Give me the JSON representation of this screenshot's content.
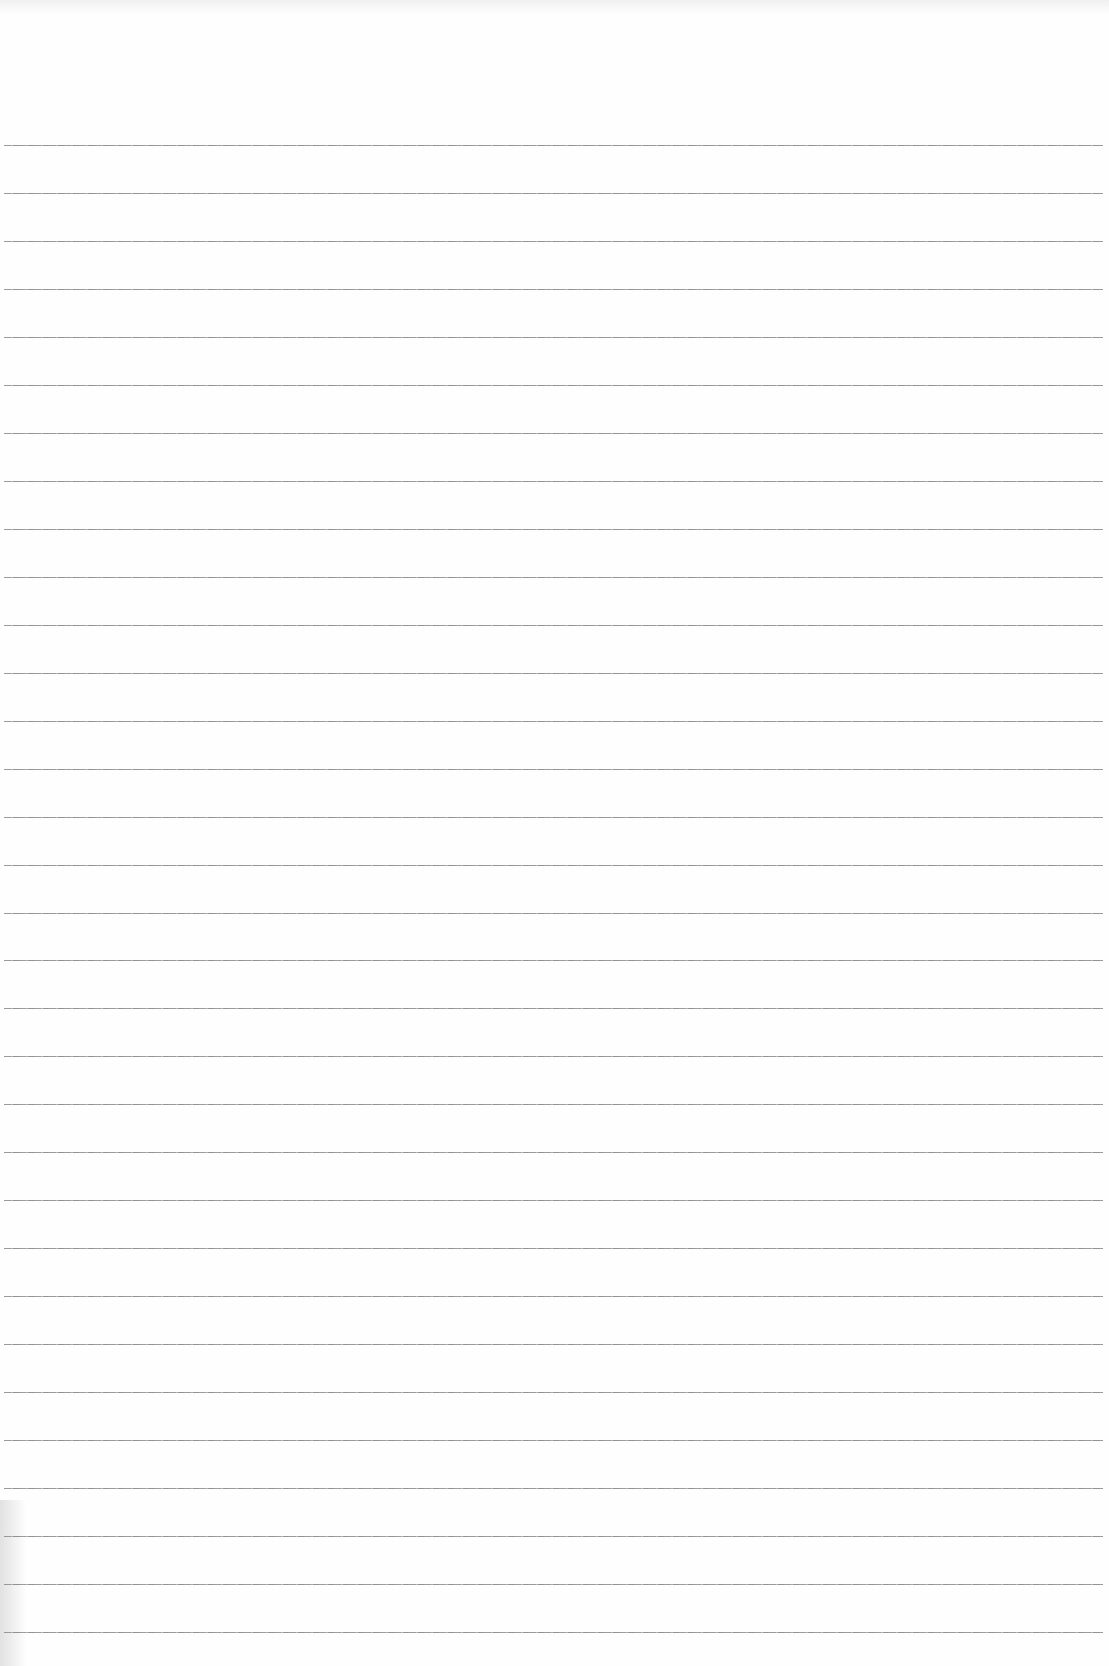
{
  "document": {
    "type": "lined-paper",
    "content_text": "",
    "rule_count": 32,
    "first_rule_y": 145,
    "rule_spacing": 47.97,
    "rule_left": 4,
    "rule_right": 1103,
    "colors": {
      "paper": "#fefefe",
      "rule": "#8a8a8a"
    }
  }
}
